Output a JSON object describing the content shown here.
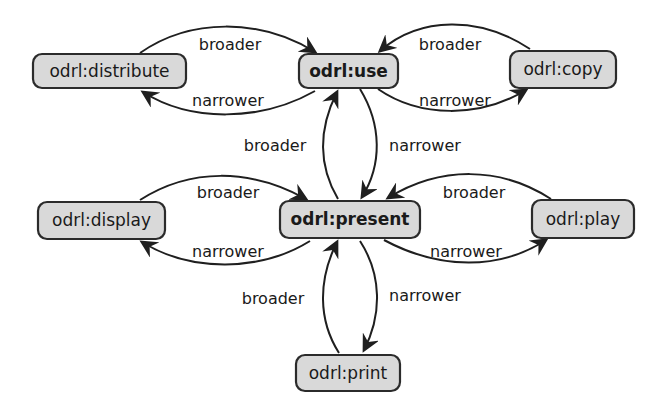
{
  "diagram": {
    "type": "concept-hierarchy",
    "nodes": {
      "distribute": {
        "label": "odrl:distribute",
        "bold": false
      },
      "use": {
        "label": "odrl:use",
        "bold": true
      },
      "copy": {
        "label": "odrl:copy",
        "bold": false
      },
      "display": {
        "label": "odrl:display",
        "bold": false
      },
      "present": {
        "label": "odrl:present",
        "bold": true
      },
      "play": {
        "label": "odrl:play",
        "bold": false
      },
      "print": {
        "label": "odrl:print",
        "bold": false
      }
    },
    "edges": [
      {
        "from": "odrl:distribute",
        "to": "odrl:use",
        "label": "broader"
      },
      {
        "from": "odrl:use",
        "to": "odrl:distribute",
        "label": "narrower"
      },
      {
        "from": "odrl:copy",
        "to": "odrl:use",
        "label": "broader"
      },
      {
        "from": "odrl:use",
        "to": "odrl:copy",
        "label": "narrower"
      },
      {
        "from": "odrl:present",
        "to": "odrl:use",
        "label": "broader"
      },
      {
        "from": "odrl:use",
        "to": "odrl:present",
        "label": "narrower"
      },
      {
        "from": "odrl:display",
        "to": "odrl:present",
        "label": "broader"
      },
      {
        "from": "odrl:present",
        "to": "odrl:display",
        "label": "narrower"
      },
      {
        "from": "odrl:play",
        "to": "odrl:present",
        "label": "broader"
      },
      {
        "from": "odrl:present",
        "to": "odrl:play",
        "label": "narrower"
      },
      {
        "from": "odrl:print",
        "to": "odrl:present",
        "label": "broader"
      },
      {
        "from": "odrl:present",
        "to": "odrl:print",
        "label": "narrower"
      }
    ],
    "labels": {
      "broader": "broader",
      "narrower": "narrower"
    },
    "colors": {
      "node_fill": "#d9d9d9",
      "node_stroke": "#2b2b2b",
      "edge": "#1f1f1f"
    }
  }
}
